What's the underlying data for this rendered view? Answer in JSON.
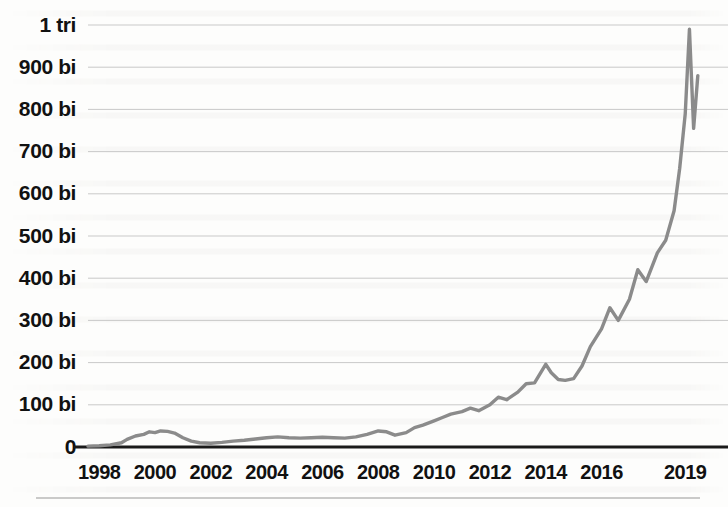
{
  "chart_data": {
    "type": "line",
    "title": "",
    "subtitle": "",
    "xlabel": "",
    "ylabel": "",
    "grid": true,
    "legend": null,
    "line_color": "#8b8b8b",
    "axis_color": "#1a1a1a",
    "gridline_color": "#c9c9c9",
    "ylim": [
      0,
      1000
    ],
    "ytick_values": [
      1000,
      900,
      800,
      700,
      600,
      500,
      400,
      300,
      200,
      100,
      0
    ],
    "ytick_labels": [
      "1 tri",
      "900 bi",
      "800 bi",
      "700 bi",
      "600 bi",
      "500 bi",
      "400 bi",
      "300 bi",
      "200 bi",
      "100 bi",
      "0"
    ],
    "y_unit_note": "bi = billion, tri = trillion",
    "xlim": [
      1997.6,
      2019.6
    ],
    "xtick_values": [
      1998,
      2000,
      2002,
      2004,
      2006,
      2008,
      2010,
      2012,
      2014,
      2016,
      2019
    ],
    "xtick_labels": [
      "1998",
      "2000",
      "2002",
      "2004",
      "2006",
      "2008",
      "2010",
      "2012",
      "2014",
      "2016",
      "2019"
    ],
    "x": [
      1997.6,
      1998.0,
      1998.4,
      1998.8,
      1999.0,
      1999.3,
      1999.6,
      1999.8,
      2000.0,
      2000.2,
      2000.45,
      2000.7,
      2001.0,
      2001.3,
      2001.6,
      2002.0,
      2002.4,
      2002.8,
      2003.2,
      2003.6,
      2004.0,
      2004.4,
      2004.8,
      2005.2,
      2005.6,
      2006.0,
      2006.4,
      2006.8,
      2007.2,
      2007.6,
      2008.0,
      2008.3,
      2008.6,
      2009.0,
      2009.3,
      2009.6,
      2010.0,
      2010.3,
      2010.6,
      2011.0,
      2011.3,
      2011.6,
      2012.0,
      2012.3,
      2012.6,
      2013.0,
      2013.3,
      2013.6,
      2014.0,
      2014.2,
      2014.45,
      2014.7,
      2015.0,
      2015.3,
      2015.6,
      2016.0,
      2016.3,
      2016.6,
      2017.0,
      2017.3,
      2017.6,
      2018.0,
      2018.3,
      2018.6,
      2018.8,
      2019.0,
      2019.15,
      2019.3,
      2019.45
    ],
    "y": [
      2,
      3,
      5,
      10,
      18,
      26,
      30,
      36,
      34,
      38,
      37,
      33,
      22,
      14,
      10,
      9,
      11,
      14,
      16,
      19,
      22,
      24,
      22,
      21,
      22,
      23,
      22,
      21,
      24,
      30,
      38,
      36,
      28,
      34,
      46,
      52,
      62,
      70,
      78,
      84,
      92,
      86,
      100,
      118,
      112,
      130,
      150,
      152,
      196,
      176,
      160,
      158,
      162,
      192,
      238,
      280,
      330,
      300,
      350,
      420,
      392,
      460,
      490,
      560,
      660,
      790,
      990,
      755,
      880
    ]
  },
  "layout": {
    "plot_left": 88,
    "plot_right": 702,
    "plot_top": 25,
    "plot_bottom": 447,
    "footer_rule_y": 498,
    "footer_rule_x1": 36,
    "footer_rule_x2": 700
  }
}
